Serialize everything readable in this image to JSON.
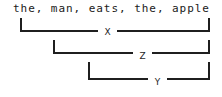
{
  "diagram": {
    "type": "dependency-bracket-annotation",
    "sentence": "the, man, eats, the, apple",
    "tokens": [
      "the",
      "man",
      "eats",
      "the",
      "apple"
    ],
    "brackets": [
      {
        "label": "X",
        "left_px": 20,
        "right_px": 208,
        "row_top_px": 18,
        "line_y_px": 30,
        "gap_start_px": 98,
        "gap_end_px": 117,
        "label_x_px": 103,
        "label_y_px": 27
      },
      {
        "label": "Z",
        "left_px": 53,
        "right_px": 208,
        "row_top_px": 40,
        "line_y_px": 52,
        "gap_start_px": 133,
        "gap_end_px": 152,
        "label_x_px": 138,
        "label_y_px": 51
      },
      {
        "label": "Y",
        "left_px": 88,
        "right_px": 208,
        "row_top_px": 62,
        "line_y_px": 78,
        "gap_start_px": 148,
        "gap_end_px": 167,
        "label_x_px": 153,
        "label_y_px": 77
      }
    ],
    "colors": {
      "background": "#ffffff",
      "ink": "#1f1f1f",
      "text": "#1a1a1a"
    }
  }
}
